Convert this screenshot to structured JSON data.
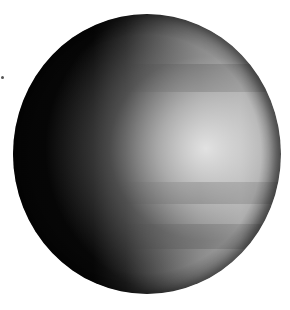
{
  "image": {
    "subject": "planet",
    "description": "Grayscale globe lit from the right, dark left hemisphere, cloud banding on the illuminated side",
    "background_color": "#ffffff",
    "colors": {
      "shadow": "#050505",
      "midtone": "#8a8a8a",
      "highlight": "#e6e6e6"
    }
  }
}
